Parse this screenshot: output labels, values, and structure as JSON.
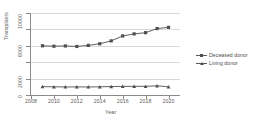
{
  "chart_data": {
    "type": "line",
    "title": "",
    "xlabel": "Year",
    "ylabel": "Transplants",
    "x": [
      2009,
      2010,
      2011,
      2012,
      2013,
      2014,
      2015,
      2016,
      2017,
      2018,
      2019,
      2020
    ],
    "series": [
      {
        "name": "Deceased donor",
        "marker": "square",
        "color": "#4f4f4f",
        "values": [
          6000,
          5950,
          5980,
          5920,
          6050,
          6250,
          6600,
          7200,
          7450,
          7600,
          8100,
          8250
        ]
      },
      {
        "name": "Living donor",
        "marker": "triangle",
        "color": "#4f4f4f",
        "values": [
          1020,
          1000,
          980,
          990,
          980,
          1000,
          1030,
          1050,
          1060,
          1060,
          1120,
          1000
        ]
      }
    ],
    "ylim": [
      0,
      10000
    ],
    "xlim": [
      2008,
      2021
    ],
    "ytick_values": [
      0,
      2000,
      4000,
      6000,
      8000,
      10000
    ],
    "ytick_labels": [
      "0",
      "2000",
      "",
      "6000",
      "",
      "10000"
    ],
    "xtick_values": [
      2008,
      2010,
      2012,
      2014,
      2016,
      2018,
      2020
    ],
    "xtick_labels": [
      "2008",
      "2010",
      "2012",
      "2014",
      "2016",
      "2018",
      "2020"
    ],
    "grid": true,
    "grid_axis": "y",
    "legend_position": "right",
    "legend": [
      "Deceased donor",
      "Living donor"
    ]
  },
  "axes": {
    "y_title": "Transplants",
    "x_title": "Year"
  },
  "legend": {
    "items": [
      {
        "label": "Deceased donor",
        "marker": "square-marker"
      },
      {
        "label": "Living donor",
        "marker": "triangle-marker"
      }
    ]
  },
  "colors": {
    "series": "#4f4f4f",
    "grid": "#d9d9d9",
    "axis": "#8a8a8a",
    "text": "#5d5d5d",
    "background": "#ffffff"
  },
  "footer": {
    "clipped_text": ""
  }
}
